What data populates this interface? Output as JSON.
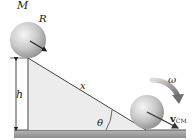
{
  "diagram": {
    "labels": {
      "mass": "M",
      "radius": "R",
      "height": "h",
      "distance": "x",
      "angle": "θ",
      "angular_velocity": "ω",
      "velocity": "v",
      "velocity_subscript": "CM"
    },
    "colors": {
      "incline_fill": "#ececec",
      "ground": "#9a9a9a",
      "sphere_light": "#f2f2f2",
      "sphere_dark": "#9e9e9e",
      "arrow": "#333333",
      "omega_arrow": "#7a7a7a"
    }
  }
}
